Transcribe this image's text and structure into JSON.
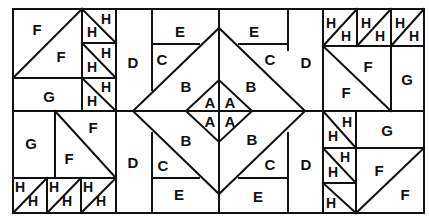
{
  "diagram": {
    "type": "quilt-block-pattern",
    "colors": {
      "line": "#111111",
      "background": "#ffffff"
    },
    "piece_labels": {
      "A": "A",
      "B": "B",
      "C": "C",
      "D": "D",
      "E": "E",
      "F": "F",
      "G": "G",
      "H": "H"
    },
    "pieces": [
      {
        "id": "tl_f1",
        "label": "F",
        "x": 37,
        "y": 29
      },
      {
        "id": "tl_f2",
        "label": "F",
        "x": 61,
        "y": 56
      },
      {
        "id": "tl_g",
        "label": "G",
        "x": 49,
        "y": 96
      },
      {
        "id": "tl_h1a",
        "label": "H",
        "x": 92,
        "y": 32
      },
      {
        "id": "tl_h1b",
        "label": "H",
        "x": 106,
        "y": 19
      },
      {
        "id": "tl_h2a",
        "label": "H",
        "x": 92,
        "y": 67
      },
      {
        "id": "tl_h2b",
        "label": "H",
        "x": 106,
        "y": 53
      },
      {
        "id": "tl_h3a",
        "label": "H",
        "x": 92,
        "y": 101
      },
      {
        "id": "tl_h3b",
        "label": "H",
        "x": 106,
        "y": 87
      },
      {
        "id": "bl_g",
        "label": "G",
        "x": 31,
        "y": 143
      },
      {
        "id": "bl_f1",
        "label": "F",
        "x": 93,
        "y": 127
      },
      {
        "id": "bl_f2",
        "label": "F",
        "x": 69,
        "y": 158
      },
      {
        "id": "bl_h1a",
        "label": "H",
        "x": 20,
        "y": 187
      },
      {
        "id": "bl_h1b",
        "label": "H",
        "x": 33,
        "y": 201
      },
      {
        "id": "bl_h2a",
        "label": "H",
        "x": 54,
        "y": 187
      },
      {
        "id": "bl_h2b",
        "label": "H",
        "x": 67,
        "y": 201
      },
      {
        "id": "bl_h3a",
        "label": "H",
        "x": 88,
        "y": 187
      },
      {
        "id": "bl_h3b",
        "label": "H",
        "x": 101,
        "y": 201
      },
      {
        "id": "l_d1",
        "label": "D",
        "x": 133,
        "y": 62
      },
      {
        "id": "l_d2",
        "label": "D",
        "x": 133,
        "y": 162
      },
      {
        "id": "tl_e",
        "label": "E",
        "x": 180,
        "y": 31
      },
      {
        "id": "tl_c",
        "label": "C",
        "x": 162,
        "y": 59
      },
      {
        "id": "tl_b",
        "label": "B",
        "x": 186,
        "y": 86
      },
      {
        "id": "bl_b",
        "label": "B",
        "x": 186,
        "y": 140
      },
      {
        "id": "bl_c",
        "label": "C",
        "x": 163,
        "y": 165
      },
      {
        "id": "bl_e",
        "label": "E",
        "x": 179,
        "y": 194
      },
      {
        "id": "a1",
        "label": "A",
        "x": 210,
        "y": 102
      },
      {
        "id": "a2",
        "label": "A",
        "x": 230,
        "y": 102
      },
      {
        "id": "a3",
        "label": "A",
        "x": 210,
        "y": 121
      },
      {
        "id": "a4",
        "label": "A",
        "x": 230,
        "y": 121
      },
      {
        "id": "tr_e",
        "label": "E",
        "x": 254,
        "y": 31
      },
      {
        "id": "tr_c",
        "label": "C",
        "x": 270,
        "y": 59
      },
      {
        "id": "tr_b",
        "label": "B",
        "x": 251,
        "y": 86
      },
      {
        "id": "br_b",
        "label": "B",
        "x": 252,
        "y": 139
      },
      {
        "id": "br_c",
        "label": "C",
        "x": 270,
        "y": 164
      },
      {
        "id": "br_e",
        "label": "E",
        "x": 258,
        "y": 196
      },
      {
        "id": "r_d1",
        "label": "D",
        "x": 306,
        "y": 62
      },
      {
        "id": "r_d2",
        "label": "D",
        "x": 306,
        "y": 164
      },
      {
        "id": "tr_h1a",
        "label": "H",
        "x": 331,
        "y": 23
      },
      {
        "id": "tr_h1b",
        "label": "H",
        "x": 346,
        "y": 36
      },
      {
        "id": "tr_h2a",
        "label": "H",
        "x": 366,
        "y": 23
      },
      {
        "id": "tr_h2b",
        "label": "H",
        "x": 380,
        "y": 36
      },
      {
        "id": "tr_h3a",
        "label": "H",
        "x": 400,
        "y": 23
      },
      {
        "id": "tr_h3b",
        "label": "H",
        "x": 414,
        "y": 36
      },
      {
        "id": "tr_f1",
        "label": "F",
        "x": 368,
        "y": 66
      },
      {
        "id": "tr_f2",
        "label": "F",
        "x": 346,
        "y": 92
      },
      {
        "id": "tr_g",
        "label": "G",
        "x": 407,
        "y": 79
      },
      {
        "id": "r_h1a",
        "label": "H",
        "x": 347,
        "y": 122
      },
      {
        "id": "r_h1b",
        "label": "H",
        "x": 333,
        "y": 136
      },
      {
        "id": "r_h2a",
        "label": "H",
        "x": 345,
        "y": 157
      },
      {
        "id": "r_h2b",
        "label": "H",
        "x": 333,
        "y": 172
      },
      {
        "id": "r_h3",
        "label": "H",
        "x": 331,
        "y": 203
      },
      {
        "id": "r_g",
        "label": "G",
        "x": 387,
        "y": 130
      },
      {
        "id": "br_f1",
        "label": "F",
        "x": 379,
        "y": 170
      },
      {
        "id": "br_f2",
        "label": "F",
        "x": 405,
        "y": 194
      }
    ]
  }
}
